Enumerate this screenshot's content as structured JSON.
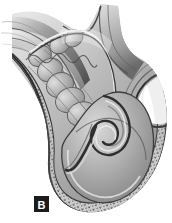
{
  "figure": {
    "panel_label": "B",
    "label_background_color": "#1b1b1b",
    "label_text_color": "#ffffff",
    "background_color": "#ffffff",
    "illustration_type": "grayscale-anatomical-line-drawing",
    "palette": {
      "outline_dark": "#2b2b2b",
      "wall_dark_band": "#6d6d6d",
      "wall_mid": "#9a9a9a",
      "mucosa_light": "#c9c9c9",
      "mucosa_mid": "#a8a8a8",
      "mucosa_shadow": "#7b7b7b",
      "highlight": "#efefef",
      "speckle_light": "#e2e2e2",
      "speckle_dark": "#5a5a5a"
    },
    "regions": [
      {
        "name": "proximal-duodenal-limb",
        "description": "layered tubular wall entering from upper left"
      },
      {
        "name": "mucosal-folds",
        "description": "scalloped valvulae conniventes lining the lumen"
      },
      {
        "name": "serosal-border",
        "description": "speckled outer band along the convex wall"
      },
      {
        "name": "superior-crest",
        "description": "rounded hump at top of the specimen"
      },
      {
        "name": "lateral-notch",
        "description": "sharp hooked indentation on right margin"
      },
      {
        "name": "duodenal-bulb",
        "description": "dilated rounded chamber at the inferior pole"
      },
      {
        "name": "coiled-papilla",
        "description": "spiral invaginated structure inside the bulb"
      }
    ]
  }
}
